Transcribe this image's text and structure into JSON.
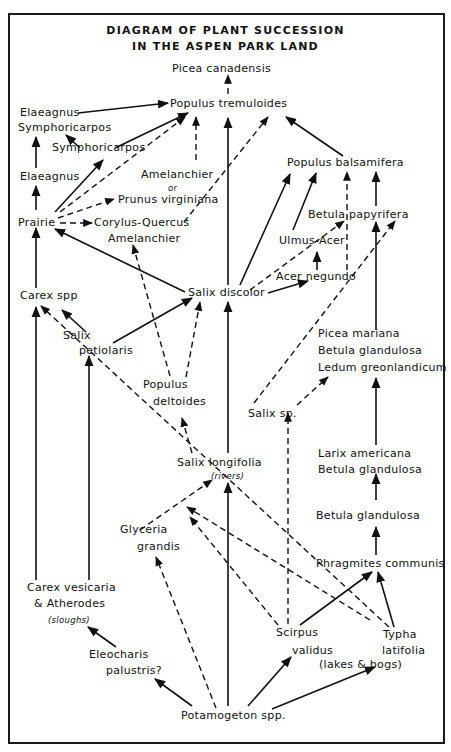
{
  "title": {
    "line1": "DIAGRAM OF PLANT SUCCESSION",
    "line2": "IN THE ASPEN PARK LAND"
  },
  "nodes": {
    "picea_canadensis": "Picea canadensis",
    "populus_tremuloides": "Populus tremuloides",
    "elaeagnus_symphoricarpos_1": "Elaeagnus",
    "elaeagnus_symphoricarpos_2": "Symphoricarpos",
    "symphoricarpos": "Symphoricarpos",
    "elaeagnus": "Elaeagnus",
    "amelanchier_or_prunus_1": "Amelanchier",
    "amelanchier_or_prunus_2": "or",
    "amelanchier_or_prunus_3": "Prunus virginiana",
    "prairie": "Prairie",
    "corylus_quercus": "Corylus-Quercus",
    "amelanchier": "Amelanchier",
    "populus_balsamifera": "Populus balsamifera",
    "betula_papyrifera": "Betula papyrifera",
    "ulmus_acer": "Ulmus-Acer",
    "acer_negundo": "Acer negundo",
    "salix_discolor": "Salix discolor",
    "carex_spp": "Carex spp",
    "salix_petiolaris_1": "Salix",
    "salix_petiolaris_2": "petiolaris",
    "populus_deltoides_1": "Populus",
    "populus_deltoides_2": "deltoides",
    "picea_mariana_group_1": "Picea mariana",
    "picea_mariana_group_2": "Betula glandulosa",
    "picea_mariana_group_3": "Ledum greonlandicum",
    "salix_sp": "Salix sp.",
    "salix_longifolia": "Salix longifolia",
    "salix_longifolia_note": "(rivers)",
    "larix_group_1": "Larix americana",
    "larix_group_2": "Betula glandulosa",
    "betula_glandulosa": "Betula glandulosa",
    "glyceria_1": "Glyceria",
    "glyceria_2": "grandis",
    "phragmites": "Phragmites communis",
    "carex_vesicaria_1": "Carex vesicaria",
    "carex_vesicaria_2": "& Atherodes",
    "carex_vesicaria_note": "(sloughs)",
    "scirpus_1": "Scirpus",
    "scirpus_2": "validus",
    "typha_1": "Typha",
    "typha_2": "latifolia",
    "lakes_bogs_note": "(lakes & bogs)",
    "eleocharis_1": "Eleocharis",
    "eleocharis_2": "palustris?",
    "potamogeton": "Potamogeton spp."
  },
  "edges": [
    {
      "from": "Populus tremuloides",
      "to": "Picea canadensis",
      "style": "dashed"
    },
    {
      "from": "Elaeagnus / Symphoricarpos",
      "to": "Populus tremuloides",
      "style": "solid"
    },
    {
      "from": "Symphoricarpos",
      "to": "Elaeagnus / Symphoricarpos",
      "style": "solid"
    },
    {
      "from": "Symphoricarpos",
      "to": "Populus tremuloides",
      "style": "solid"
    },
    {
      "from": "Elaeagnus",
      "to": "Elaeagnus / Symphoricarpos",
      "style": "solid"
    },
    {
      "from": "Prairie",
      "to": "Elaeagnus",
      "style": "solid"
    },
    {
      "from": "Prairie",
      "to": "Symphoricarpos",
      "style": "solid"
    },
    {
      "from": "Prairie",
      "to": "Populus tremuloides",
      "style": "dashed"
    },
    {
      "from": "Prairie",
      "to": "Prunus virginiana",
      "style": "dashed"
    },
    {
      "from": "Prairie",
      "to": "Corylus-Quercus",
      "style": "dashed"
    },
    {
      "from": "Amelanchier or Prunus virginiana",
      "to": "Populus tremuloides",
      "style": "dashed"
    },
    {
      "from": "Corylus-Quercus",
      "to": "Populus tremuloides",
      "style": "dashed"
    },
    {
      "from": "Populus balsamifera",
      "to": "Populus tremuloides",
      "style": "solid"
    },
    {
      "from": "Salix discolor",
      "to": "Populus tremuloides",
      "style": "solid"
    },
    {
      "from": "Salix discolor",
      "to": "Prairie",
      "style": "solid"
    },
    {
      "from": "Salix discolor",
      "to": "Populus balsamifera",
      "style": "solid"
    },
    {
      "from": "Salix discolor",
      "to": "Betula papyrifera",
      "style": "dashed"
    },
    {
      "from": "Salix discolor",
      "to": "Acer negundo",
      "style": "solid"
    },
    {
      "from": "Ulmus-Acer",
      "to": "Populus balsamifera",
      "style": "solid"
    },
    {
      "from": "Acer negundo",
      "to": "Ulmus-Acer",
      "style": "solid"
    },
    {
      "from": "Acer negundo",
      "to": "Populus balsamifera",
      "style": "dashed"
    },
    {
      "from": "Betula papyrifera",
      "to": "Populus balsamifera",
      "style": "solid"
    },
    {
      "from": "Picea mariana group",
      "to": "Betula papyrifera",
      "style": "solid"
    },
    {
      "from": "Salix sp.",
      "to": "Betula papyrifera",
      "style": "dashed"
    },
    {
      "from": "Salix sp.",
      "to": "Picea mariana group",
      "style": "dashed"
    },
    {
      "from": "Carex spp",
      "to": "Prairie",
      "style": "solid"
    },
    {
      "from": "Salix petiolaris",
      "to": "Carex spp",
      "style": "solid"
    },
    {
      "from": "Salix petiolaris",
      "to": "Salix discolor",
      "style": "solid"
    },
    {
      "from": "Populus deltoides",
      "to": "Amelanchier",
      "style": "dashed"
    },
    {
      "from": "Populus deltoides",
      "to": "Salix discolor",
      "style": "dashed"
    },
    {
      "from": "Salix longifolia",
      "to": "Populus deltoides",
      "style": "dashed"
    },
    {
      "from": "Salix longifolia",
      "to": "Salix discolor",
      "style": "solid"
    },
    {
      "from": "Larix group",
      "to": "Picea mariana group",
      "style": "solid"
    },
    {
      "from": "Betula glandulosa",
      "to": "Larix group",
      "style": "solid"
    },
    {
      "from": "Phragmites communis",
      "to": "Betula glandulosa",
      "style": "solid"
    },
    {
      "from": "Glyceria grandis",
      "to": "Salix longifolia",
      "style": "dashed"
    },
    {
      "from": "Typha latifolia",
      "to": "Carex spp",
      "style": "dashed"
    },
    {
      "from": "Typha latifolia",
      "to": "Phragmites communis",
      "style": "solid"
    },
    {
      "from": "Scirpus validus",
      "to": "Phragmites communis",
      "style": "solid"
    },
    {
      "from": "Scirpus validus",
      "to": "Salix sp.",
      "style": "dashed"
    },
    {
      "from": "Scirpus validus",
      "to": "Glyceria crossing",
      "style": "dashed"
    },
    {
      "from": "Carex vesicaria & Atherodes",
      "to": "Carex spp",
      "style": "solid"
    },
    {
      "from": "Carex vesicaria & Atherodes",
      "to": "Salix petiolaris",
      "style": "solid"
    },
    {
      "from": "Eleocharis palustris?",
      "to": "Carex vesicaria & Atherodes",
      "style": "solid"
    },
    {
      "from": "Potamogeton spp.",
      "to": "Eleocharis palustris?",
      "style": "solid"
    },
    {
      "from": "Potamogeton spp.",
      "to": "Glyceria grandis",
      "style": "dashed"
    },
    {
      "from": "Potamogeton spp.",
      "to": "Salix longifolia",
      "style": "solid"
    },
    {
      "from": "Potamogeton spp.",
      "to": "Scirpus validus",
      "style": "solid"
    },
    {
      "from": "Potamogeton spp.",
      "to": "Typha latifolia",
      "style": "solid"
    }
  ]
}
